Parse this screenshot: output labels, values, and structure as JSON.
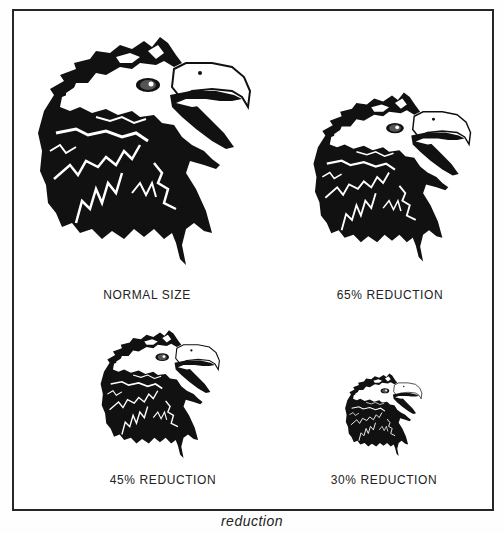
{
  "figure": {
    "caption": "reduction",
    "panels": [
      {
        "id": "normal",
        "label": "NORMAL SIZE",
        "scale_percent": 100
      },
      {
        "id": "r65",
        "label": "65% REDUCTION",
        "scale_percent": 65
      },
      {
        "id": "r45",
        "label": "45% REDUCTION",
        "scale_percent": 45
      },
      {
        "id": "r30",
        "label": "30% REDUCTION",
        "scale_percent": 30
      }
    ],
    "illustration": "eagle-head",
    "colors": {
      "ink": "#111111",
      "paper": "#ffffff",
      "border": "#262626"
    }
  }
}
